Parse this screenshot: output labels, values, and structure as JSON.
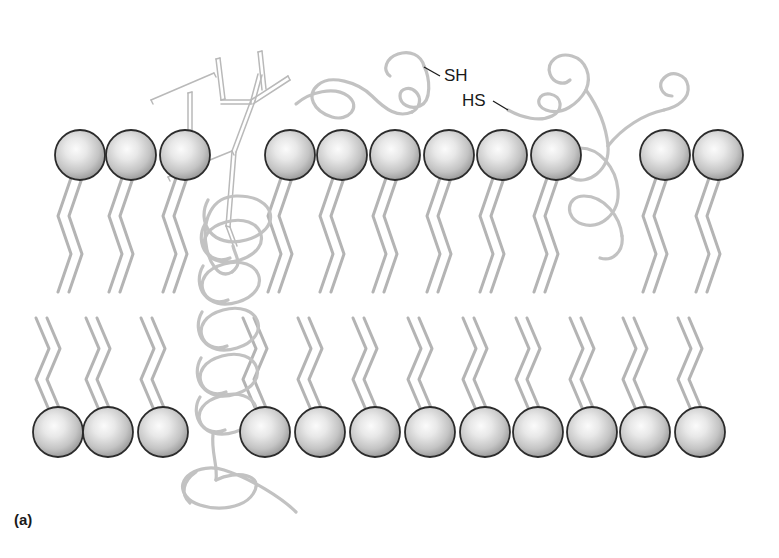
{
  "figure": {
    "label": "(a)",
    "background_color": "#ffffff"
  },
  "labels": [
    {
      "id": "sh-left",
      "text": "SH",
      "x": 444,
      "y": 81,
      "anchor": "start",
      "leader_from_x": 440,
      "leader_from_y": 76,
      "leader_to_x": 424,
      "leader_to_y": 67
    },
    {
      "id": "hs-right",
      "text": "HS",
      "x": 462,
      "y": 106,
      "anchor": "start",
      "leader_from_x": 493,
      "leader_from_y": 101,
      "leader_to_x": 508,
      "leader_to_y": 110
    }
  ],
  "colors": {
    "headgroup_outline": "#2b2b2b",
    "headgroup_light": "#f2f2f2",
    "headgroup_mid": "#c9c9c9",
    "headgroup_dark": "#8e8e8e",
    "tail_stroke": "#b4b4b4",
    "protein_stroke": "#c2c2c2",
    "glycan_stroke": "#b9b9b9",
    "text": "#1a1a1a"
  },
  "bilayer": {
    "name": "phospholipid-bilayer",
    "headgroup_radius": 25,
    "upper_leaflet": {
      "name": "outer-leaflet",
      "head_center_y": 155,
      "tail_top_y": 178,
      "tail_bottom_y": 292,
      "head_x_positions": [
        80,
        131,
        185,
        290,
        342,
        395,
        449,
        502,
        556,
        665,
        718
      ]
    },
    "lower_leaflet": {
      "name": "inner-leaflet",
      "head_center_y": 432,
      "tail_top_y": 318,
      "tail_bottom_y": 410,
      "head_x_positions": [
        58,
        108,
        163,
        265,
        320,
        375,
        430,
        485,
        538,
        592,
        645,
        700
      ]
    },
    "tail_offsets": [
      -9,
      2
    ],
    "zigzag_amplitude": 13
  },
  "proteins": [
    {
      "id": "glycoprotein-transmembrane",
      "name": "transmembrane-glycoprotein",
      "description": "Integral transmembrane protein with extracellular branched oligosaccharide and coiled membrane-spanning helix",
      "has_glycan": true,
      "coil_loops": 5
    },
    {
      "id": "peripheral-protein-sh",
      "name": "peripheral-protein-with-thiol",
      "description": "Surface-associated protein on the outer leaflet bearing a free sulfhydryl (SH) group",
      "has_glycan": false
    },
    {
      "id": "peripheral-protein-hs",
      "name": "lipid-anchored-protein-with-thiol",
      "description": "Outer-surface protein with looping chain and free sulfhydryl (HS) group threading between head groups",
      "has_glycan": false
    }
  ],
  "chart_data": {
    "type": "diagram",
    "elements": {
      "upper_headgroups": 11,
      "lower_headgroups": 12,
      "tails_per_lipid": 2,
      "proteins": 3,
      "thiol_labels": [
        "SH",
        "HS"
      ],
      "glycan_chains": 1
    }
  }
}
